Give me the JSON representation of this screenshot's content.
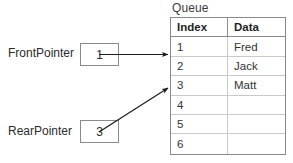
{
  "diagram": {
    "title": "Queue",
    "table": {
      "columns": [
        "Index",
        "Data"
      ],
      "rows": [
        {
          "index": "1",
          "data": "Fred"
        },
        {
          "index": "2",
          "data": "Jack"
        },
        {
          "index": "3",
          "data": "Matt"
        },
        {
          "index": "4",
          "data": ""
        },
        {
          "index": "5",
          "data": ""
        },
        {
          "index": "6",
          "data": ""
        }
      ]
    },
    "pointers": [
      {
        "label": "FrontPointer",
        "value": "1",
        "target_index": "1"
      },
      {
        "label": "RearPointer",
        "value": "3",
        "target_index": "3"
      }
    ],
    "colors": {
      "outer_border": "#8a8a8a",
      "inner_border": "#c9c9c9",
      "text": "#333333",
      "arrow": "#1a1a1a",
      "background": "#ffffff"
    },
    "arrows": {
      "front_arrow_name": "front-pointer-arrow",
      "rear_arrow_name": "rear-pointer-arrow"
    }
  }
}
